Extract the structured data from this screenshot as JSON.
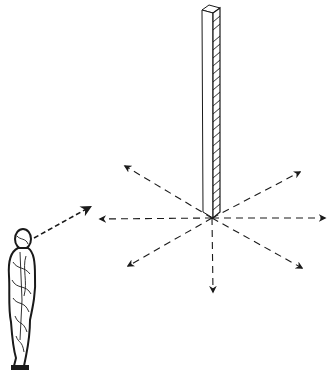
{
  "figure": {
    "type": "line-drawing",
    "colors": {
      "background": "#ffffff",
      "ink": "#1a1a1a"
    },
    "pillar": {
      "x": 212,
      "top": 6,
      "bottom": 218,
      "width": 12
    },
    "origin": {
      "x": 212,
      "y": 218
    },
    "arrows": [
      {
        "name": "up-left",
        "x": 125,
        "y": 166
      },
      {
        "name": "up-right",
        "x": 300,
        "y": 172
      },
      {
        "name": "left",
        "x": 100,
        "y": 219
      },
      {
        "name": "right",
        "x": 325,
        "y": 218
      },
      {
        "name": "down-left",
        "x": 128,
        "y": 266
      },
      {
        "name": "down-right",
        "x": 302,
        "y": 268
      },
      {
        "name": "down",
        "x": 213,
        "y": 292
      }
    ],
    "gaze_arrow": {
      "from_x": 34,
      "from_y": 238,
      "to_x": 90,
      "to_y": 207
    },
    "person": {
      "x": 4,
      "y": 228,
      "width": 40,
      "height": 140
    }
  }
}
